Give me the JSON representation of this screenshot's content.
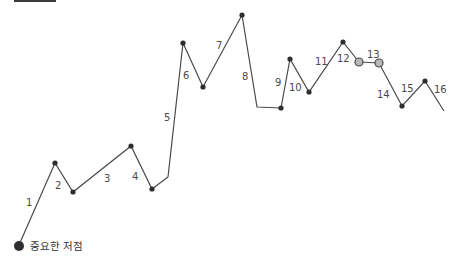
{
  "diagram": {
    "line_color": "#4a4a4a",
    "dot_color": "#2e2e2e",
    "highlight_fill": "#b8b8b8",
    "path_points": [
      [
        19,
        245
      ],
      [
        55,
        163
      ],
      [
        73,
        192
      ],
      [
        131,
        146
      ],
      [
        152,
        189
      ],
      [
        168,
        177
      ],
      [
        183,
        43
      ],
      [
        203,
        87
      ],
      [
        242,
        15
      ],
      [
        257,
        107
      ],
      [
        281,
        108
      ],
      [
        290,
        59
      ],
      [
        309,
        92
      ],
      [
        343,
        42
      ],
      [
        359,
        62
      ],
      [
        379,
        63
      ],
      [
        402,
        106
      ],
      [
        425,
        81
      ],
      [
        444,
        111
      ]
    ],
    "dots": [
      {
        "x": 55,
        "y": 163,
        "type": "normal"
      },
      {
        "x": 73,
        "y": 192,
        "type": "normal"
      },
      {
        "x": 131,
        "y": 146,
        "type": "normal"
      },
      {
        "x": 152,
        "y": 189,
        "type": "normal"
      },
      {
        "x": 183,
        "y": 43,
        "type": "normal"
      },
      {
        "x": 203,
        "y": 87,
        "type": "normal"
      },
      {
        "x": 242,
        "y": 15,
        "type": "normal"
      },
      {
        "x": 281,
        "y": 108,
        "type": "normal"
      },
      {
        "x": 290,
        "y": 59,
        "type": "normal"
      },
      {
        "x": 309,
        "y": 92,
        "type": "normal"
      },
      {
        "x": 343,
        "y": 42,
        "type": "normal"
      },
      {
        "x": 359,
        "y": 62,
        "type": "highlight"
      },
      {
        "x": 379,
        "y": 63,
        "type": "highlight"
      },
      {
        "x": 402,
        "y": 106,
        "type": "normal"
      },
      {
        "x": 425,
        "y": 81,
        "type": "normal"
      }
    ],
    "segment_labels": [
      {
        "text": "1",
        "x": 26,
        "y": 206
      },
      {
        "text": "2",
        "x": 55,
        "y": 189
      },
      {
        "text": "3",
        "x": 104,
        "y": 182
      },
      {
        "text": "4",
        "x": 132,
        "y": 180
      },
      {
        "text": "5",
        "x": 164,
        "y": 121
      },
      {
        "text": "6",
        "x": 183,
        "y": 79
      },
      {
        "text": "7",
        "x": 216,
        "y": 49
      },
      {
        "text": "8",
        "x": 242,
        "y": 80
      },
      {
        "text": "9",
        "x": 275,
        "y": 86
      },
      {
        "text": "10",
        "x": 289,
        "y": 91
      },
      {
        "text": "11",
        "x": 315,
        "y": 65
      },
      {
        "text": "12",
        "x": 337,
        "y": 62
      },
      {
        "text": "13",
        "x": 367,
        "y": 58
      },
      {
        "text": "14",
        "x": 377,
        "y": 98
      },
      {
        "text": "15",
        "x": 401,
        "y": 92
      },
      {
        "text": "16",
        "x": 434,
        "y": 93
      }
    ],
    "legend": {
      "label": "중요한 저점",
      "dot_x": 19,
      "dot_y": 246
    }
  }
}
